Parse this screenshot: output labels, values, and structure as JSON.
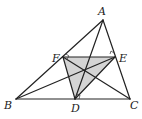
{
  "diagram": {
    "type": "geometry",
    "colors": {
      "line": "#222222",
      "shade": "#d4d4d4",
      "background": "#ffffff"
    },
    "points": {
      "A": {
        "label": "A",
        "x": 103,
        "y": 20
      },
      "B": {
        "label": "B",
        "x": 16,
        "y": 99
      },
      "C": {
        "label": "C",
        "x": 130,
        "y": 99
      },
      "D": {
        "label": "D",
        "x": 75,
        "y": 99
      },
      "E": {
        "label": "E",
        "x": 115,
        "y": 57
      },
      "F": {
        "label": "F",
        "x": 63,
        "y": 57
      },
      "H": {
        "x": 76,
        "y": 70
      }
    },
    "labels": {
      "A": "A",
      "B": "B",
      "C": "C",
      "D": "D",
      "E": "E",
      "F": "F"
    },
    "segments": [
      "AB",
      "BC",
      "CA",
      "AD",
      "BE",
      "CF",
      "DE",
      "EF",
      "FD"
    ],
    "shaded_region": "triangle DEF",
    "right_angle_marks": [
      "F",
      "E",
      "D"
    ]
  }
}
